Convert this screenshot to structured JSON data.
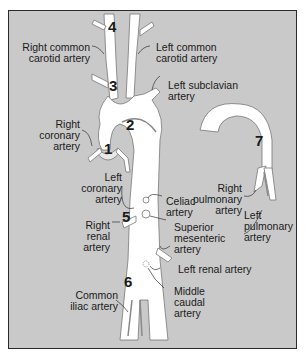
{
  "figure": {
    "title": "",
    "numbers": {
      "n1": "1",
      "n2": "2",
      "n3": "3",
      "n4": "4",
      "n5": "5",
      "n6": "6",
      "n7": "7"
    },
    "labels": {
      "right_common_carotid": [
        "Right common",
        "carotid artery"
      ],
      "left_common_carotid": [
        "Left common",
        "carotid artery"
      ],
      "left_subclavian": [
        "Left subclavian",
        "artery"
      ],
      "right_coronary": [
        "Right",
        "coronary",
        "artery"
      ],
      "left_coronary": [
        "Left",
        "coronary",
        "artery"
      ],
      "celiac": [
        "Celiac",
        "artery"
      ],
      "superior_mesenteric": [
        "Superior",
        "mesenteric",
        "artery"
      ],
      "right_renal": [
        "Right",
        "renal",
        "artery"
      ],
      "left_renal": [
        "Left renal artery"
      ],
      "middle_caudal": [
        "Middle",
        "caudal",
        "artery"
      ],
      "common_iliac": [
        "Common",
        "iliac artery"
      ],
      "right_pulmonary": [
        "Right",
        "pulmonary",
        "artery"
      ],
      "left_pulmonary": [
        "Left",
        "pulmonary",
        "artery"
      ]
    },
    "colors": {
      "background": "#c9c9c9",
      "vessel": "#ffffff",
      "vessel_shade": "#8a8a8a",
      "leader": "#333333"
    }
  }
}
